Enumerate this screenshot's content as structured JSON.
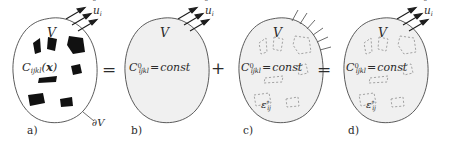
{
  "figure": {
    "type": "micromechanics-decomposition-diagram",
    "width": 455,
    "height": 150,
    "background": "#ffffff",
    "ink_color": "#2b2b2b",
    "blob_fill_gray": "#f0f0f0",
    "inclusion_fill_black": "#111111",
    "dashed_inclusion_color": "#9a9a9a"
  },
  "operators": [
    {
      "id": "eq1",
      "symbol": "=",
      "x": 104,
      "y": 62
    },
    {
      "id": "plus1",
      "symbol": "+",
      "x": 214,
      "y": 62
    },
    {
      "id": "eq2",
      "symbol": "=",
      "x": 319,
      "y": 62
    }
  ],
  "panels": [
    {
      "id": "a",
      "label": "a)",
      "label_x": 27,
      "label_y": 130,
      "volume_label": "V",
      "material_symbol": "C",
      "material_sub": "ijkl",
      "material_arg": "x",
      "material_text": "C_ijkl(x)",
      "boundary_label": "∂V",
      "traction_label": "u",
      "traction_sub": "i",
      "traction_text": "û_i",
      "boundary_condition": "prescribed-displacement-arrows",
      "inclusions": "solid-black",
      "blob_filled": false
    },
    {
      "id": "b",
      "label": "b)",
      "label_x": 131,
      "label_y": 130,
      "volume_label": "V",
      "material_symbol": "C",
      "material_sup": "0",
      "material_sub": "ijkl",
      "material_rhs": "const",
      "material_text": "C⁰_ijkl = const",
      "traction_label": "u",
      "traction_sub": "i",
      "traction_text": "û_i",
      "boundary_condition": "prescribed-displacement-arrows",
      "inclusions": "none",
      "blob_filled": true
    },
    {
      "id": "c",
      "label": "c)",
      "label_x": 243,
      "label_y": 130,
      "volume_label": "V",
      "material_symbol": "C",
      "material_sup": "0",
      "material_sub": "ijkl",
      "material_rhs": "const",
      "material_text": "C⁰_ijkl = const",
      "eigenstrain_symbol": "ε",
      "eigenstrain_sup": "*",
      "eigenstrain_sub": "ij",
      "eigenstrain_text": "ε*_ij",
      "boundary_condition": "fixed-hatched-support",
      "inclusions": "dashed-outline",
      "blob_filled": true
    },
    {
      "id": "d",
      "label": "d)",
      "label_x": 348,
      "label_y": 130,
      "volume_label": "V",
      "material_symbol": "C",
      "material_sup": "0",
      "material_sub": "ijkl",
      "material_rhs": "const",
      "material_text": "C⁰_ijkl = const",
      "eigenstrain_symbol": "ε",
      "eigenstrain_sup": "*",
      "eigenstrain_sub": "ij",
      "eigenstrain_text": "ε*_ij",
      "traction_label": "u",
      "traction_sub": "i",
      "traction_text": "û_i",
      "boundary_condition": "prescribed-displacement-arrows",
      "inclusions": "dashed-outline",
      "blob_filled": true
    }
  ]
}
